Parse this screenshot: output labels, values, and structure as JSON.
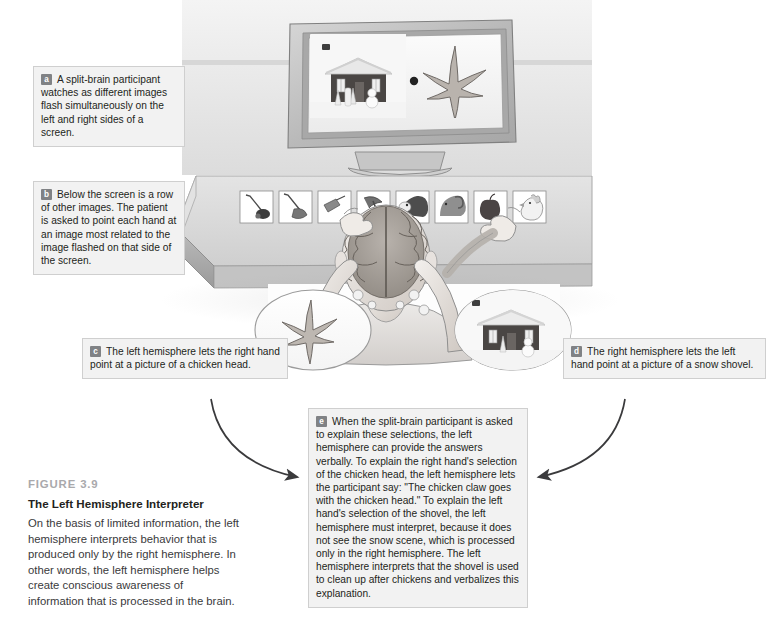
{
  "figure": {
    "number": "FIGURE 3.9",
    "title": "The Left Hemisphere Interpreter",
    "caption": "On the basis of limited information, the left hemisphere interprets behavior that is produced only by the right hemisphere. In other words, the left hemisphere helps create conscious awareness of information that is processed in the brain."
  },
  "callouts": [
    {
      "id": "a",
      "badge": "a",
      "text": "A split-brain participant watches as different images flash simultaneously on the left and right sides of a screen."
    },
    {
      "id": "b",
      "badge": "b",
      "text": "Below the screen is a row of other images. The patient is asked to point each hand at an image most related to the image flashed on that side of the screen."
    },
    {
      "id": "c",
      "badge": "c",
      "text": "The left hemisphere lets the right hand point at a picture of a chicken head."
    },
    {
      "id": "d",
      "badge": "d",
      "text": "The right hemisphere lets the left hand point at a picture of a snow shovel."
    },
    {
      "id": "e",
      "badge": "e",
      "text": "When the split-brain participant is asked to explain these selections, the left hemisphere can provide the answers verbally. To explain the right hand's selection of the chicken head, the left hemisphere lets the participant say: \"The chicken claw goes with the chicken head.\" To explain the left hand's selection of the shovel, the left hemisphere must interpret, because it does not see the snow scene, which is processed only in the right hemisphere. The left hemisphere interprets that the shovel is used to clean up after chickens and verbalizes this explanation."
    }
  ],
  "illustration": {
    "monitor": {
      "label": "computer-monitor",
      "screen_left_image": "snow-scene-house",
      "screen_right_image": "chicken-claw"
    },
    "card_row": [
      "lawn-mower",
      "snow-shovel",
      "hand-saw",
      "pickaxe",
      "cow",
      "ram",
      "apple",
      "chicken-head"
    ],
    "insets": [
      {
        "side": "left",
        "image": "chicken-claw"
      },
      {
        "side": "right",
        "image": "snow-scene-house"
      }
    ],
    "participant": "split-brain-participant-seen-from-behind-with-brain-overlay"
  },
  "colors": {
    "callout_bg": "#f2f2f2",
    "callout_border": "#cfcfcf",
    "badge_bg": "#808285",
    "fig_num": "#a9a9ac",
    "text": "#231f20",
    "arrow": "#3a3a3c",
    "desk": "#d8d8d8",
    "wall": "#eaeaea"
  }
}
